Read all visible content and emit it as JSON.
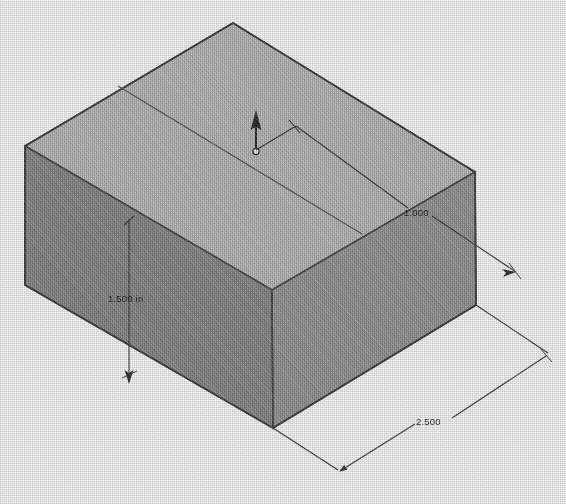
{
  "scene": {
    "title": "Isometric rectangular block",
    "background_color": "#ffffff",
    "units": "in",
    "view": "isometric"
  },
  "solid": {
    "name": "rectangular-block",
    "faces": {
      "top_label": "top face",
      "top_color": "#b9b9b9",
      "left_label": "left face",
      "left_color": "#8a8a8a",
      "right_label": "right face",
      "right_color": "#979797"
    },
    "edge_color": "#4a4a4a",
    "sketch_line_color": "#555555"
  },
  "origin": {
    "marker_label": "origin",
    "axis_arrow_label": "z-axis-up",
    "arrow_color": "#2b2b2b",
    "dot_color": "#f2f2f2"
  },
  "dimensions": [
    {
      "id": "height",
      "value": "1.500 in",
      "orientation": "vertical",
      "description": "block height"
    },
    {
      "id": "depth",
      "value": "1.000",
      "orientation": "diagonal-right",
      "description": "block depth"
    },
    {
      "id": "width",
      "value": "2.500",
      "orientation": "diagonal-bottom",
      "description": "block width"
    }
  ],
  "dimension_style": {
    "line_color": "#3c3c3c",
    "text_color": "#1f1f1f",
    "arrow_style": "slash-and-arrow"
  }
}
